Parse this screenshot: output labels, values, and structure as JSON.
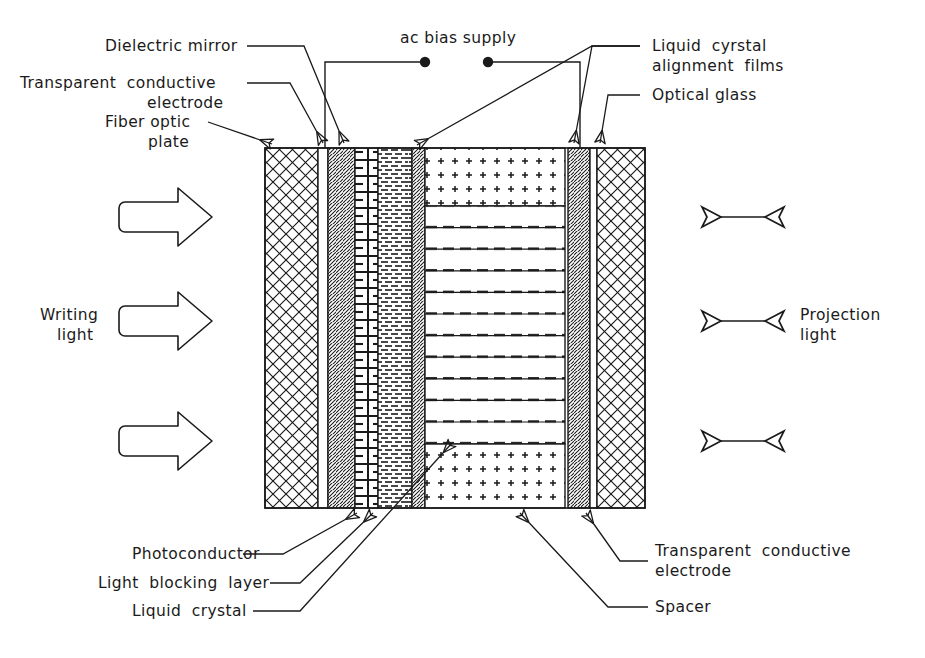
{
  "figure": {
    "stroke_color": "#1a1a1a",
    "background_color": "#ffffff"
  },
  "power_supply": {
    "label": "ac bias supply",
    "terminal_left": "terminal-dot",
    "terminal_right": "terminal-dot"
  },
  "labels_top_left": [
    {
      "id": "dielectric-mirror",
      "text": "Dielectric mirror"
    },
    {
      "id": "transparent-conductive-electrode",
      "line1": "Transparent  conductive",
      "line2": "electrode"
    },
    {
      "id": "fiber-optic-plate",
      "line1": "Fiber optic",
      "line2": "plate"
    }
  ],
  "labels_top_right": [
    {
      "id": "liquid-crystal-alignment-films",
      "line1": "Liquid  cyrstal",
      "line2": "alignment  films"
    },
    {
      "id": "optical-glass",
      "text": "Optical glass"
    }
  ],
  "labels_bottom_left": [
    {
      "id": "photoconductor",
      "text": "Photoconductor"
    },
    {
      "id": "light-blocking-layer",
      "text": "Light  blocking  layer"
    },
    {
      "id": "liquid-crystal",
      "text": "Liquid  crystal"
    }
  ],
  "labels_bottom_right": [
    {
      "id": "transparent-conductive-electrode-2",
      "line1": "Transparent  conductive",
      "line2": "electrode"
    },
    {
      "id": "spacer",
      "text": "Spacer"
    }
  ],
  "side_labels": {
    "writing_light": {
      "line1": "Writing",
      "line2": "light"
    },
    "projection_light": {
      "line1": "Projection",
      "line2": "light"
    }
  },
  "arrows": {
    "writing_light_count": 3,
    "projection_light_count": 3,
    "writing_style": "block-arrow-right",
    "projection_style": "double-headed-arrow"
  },
  "stack_layers": [
    {
      "id": "fiber-optic-plate",
      "pattern": "cross-hatch",
      "x": 265,
      "width": 53
    },
    {
      "id": "transparent-conductive-electrode-left",
      "pattern": "blank",
      "x": 318,
      "width": 10
    },
    {
      "id": "dielectric-mirror",
      "pattern": "diagonal-hatch",
      "x": 328,
      "width": 27
    },
    {
      "id": "light-blocking-layer",
      "pattern": "boxed-dashes",
      "x": 355,
      "width": 23
    },
    {
      "id": "photoconductor",
      "pattern": "dense-dashes",
      "x": 378,
      "width": 34
    },
    {
      "id": "alignment-film-left",
      "pattern": "diagonal-hatch",
      "x": 412,
      "width": 13
    },
    {
      "id": "liquid-crystal-cell",
      "pattern": "lc-layers-and-spacer-dots",
      "x": 425,
      "width": 140
    },
    {
      "id": "alignment-film-right",
      "pattern": "diagonal-hatch",
      "x": 568,
      "width": 22
    },
    {
      "id": "transparent-conductive-electrode-right",
      "pattern": "blank",
      "x": 590,
      "width": 7
    },
    {
      "id": "optical-glass",
      "pattern": "cross-hatch",
      "x": 597,
      "width": 48
    }
  ],
  "liquid_crystal": {
    "band_count": 11,
    "top_spacer_region": "dotted",
    "bottom_spacer_region": "dotted"
  }
}
